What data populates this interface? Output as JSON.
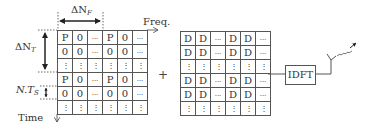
{
  "labels": {
    "delta_nf": "ΔN",
    "delta_nf_sub": "F",
    "freq": "Freq.",
    "delta_nt": "ΔN",
    "delta_nt_sub": "T",
    "nts": "N.T",
    "nts_sub": "S",
    "time": "Time",
    "plus": "+",
    "idft": "IDFT"
  },
  "pilot_grid": {
    "rows": [
      [
        "P",
        "0",
        "...",
        "P",
        "0",
        "..."
      ],
      [
        "0",
        "0",
        "...",
        "0",
        "0",
        "..."
      ],
      [
        "⋮",
        "⋮",
        "⋮",
        "⋮",
        "⋮",
        "⋮"
      ],
      [
        "P",
        "0",
        "...",
        "P",
        "0",
        "..."
      ],
      [
        "0",
        "0",
        "...",
        "0",
        "0",
        "..."
      ],
      [
        "⋮",
        "⋮",
        "⋮",
        "⋮",
        "⋮",
        "⋮"
      ]
    ]
  },
  "data_grid": {
    "rows": [
      [
        "D",
        "D",
        "...",
        "D",
        "D",
        "..."
      ],
      [
        "D",
        "D",
        "...",
        "D",
        "D",
        "..."
      ],
      [
        "⋮",
        "⋮",
        "⋮",
        "⋮",
        "⋮",
        "⋮"
      ],
      [
        "D",
        "D",
        "...",
        "D",
        "D",
        "..."
      ],
      [
        "D",
        "D",
        "...",
        "D",
        "D",
        "..."
      ],
      [
        "⋮",
        "⋮",
        "⋮",
        "⋮",
        "⋮",
        "⋮"
      ]
    ]
  },
  "icons": {
    "antenna": "antenna-icon"
  }
}
